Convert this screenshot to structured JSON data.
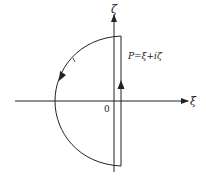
{
  "diagram": {
    "axes": {
      "vertical_label": "ζ",
      "horizontal_label": "ξ",
      "origin_label": "0"
    },
    "point_label": "P=ξ+iζ",
    "contour": {
      "description": "closed contour: vertical segment right of imaginary axis traversed upward, then semicircular-like arc to the left traversed counterclockwise",
      "arrow_directions": [
        "up on vertical segment",
        "counterclockwise on arc"
      ]
    },
    "colors": {
      "line": "#222222",
      "background": "#ffffff"
    }
  }
}
